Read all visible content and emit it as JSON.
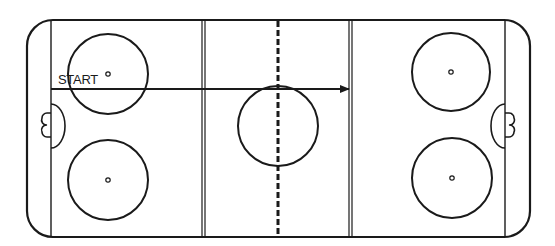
{
  "diagram": {
    "type": "hockey-rink-drill",
    "labels": {
      "start": "START"
    },
    "colors": {
      "line": "#1a1a1a",
      "background": "#ffffff"
    },
    "rink": {
      "outer": {
        "x": 27,
        "y": 20,
        "width": 503,
        "height": 217,
        "corner_radius": 26
      },
      "goal_line_left_x": 51,
      "goal_line_right_x": 505,
      "blue_line_left_x": 203,
      "blue_line_right_x": 350,
      "center_line_x": 278
    },
    "circles": [
      {
        "name": "faceoff-circle-top-left",
        "cx": 108,
        "cy": 74,
        "r": 40
      },
      {
        "name": "faceoff-circle-bottom-left",
        "cx": 108,
        "cy": 180,
        "r": 40
      },
      {
        "name": "center-circle",
        "cx": 278,
        "cy": 126,
        "r": 40
      },
      {
        "name": "faceoff-circle-top-right",
        "cx": 451,
        "cy": 72,
        "r": 39
      },
      {
        "name": "faceoff-circle-bottom-right",
        "cx": 452,
        "cy": 178,
        "r": 40
      }
    ],
    "arrow": {
      "from": {
        "x": 51,
        "y": 89
      },
      "to": {
        "x": 349,
        "y": 89
      }
    }
  }
}
